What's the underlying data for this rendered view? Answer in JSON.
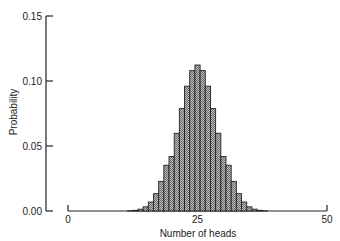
{
  "chart_data": {
    "type": "bar",
    "title": "",
    "xlabel": "Number of heads",
    "ylabel": "Probability",
    "ylim": [
      0,
      0.15
    ],
    "xlim": [
      0,
      50
    ],
    "yticks": [
      "0.00",
      "0.05",
      "0.10",
      "0.15"
    ],
    "xticks": [
      "0",
      "25",
      "50"
    ],
    "grid": false,
    "x": [
      12,
      13,
      14,
      15,
      16,
      17,
      18,
      19,
      20,
      21,
      22,
      23,
      24,
      25,
      26,
      27,
      28,
      29,
      30,
      31,
      32,
      33,
      34,
      35,
      36,
      37,
      38
    ],
    "values": [
      0.0002,
      0.0005,
      0.0014,
      0.0032,
      0.0069,
      0.0133,
      0.0228,
      0.0352,
      0.0419,
      0.0598,
      0.0788,
      0.096,
      0.108,
      0.1123,
      0.108,
      0.096,
      0.0788,
      0.0598,
      0.0419,
      0.0352,
      0.0228,
      0.0133,
      0.0069,
      0.0032,
      0.0014,
      0.0005,
      0.0002
    ],
    "bar_color": "#9a9a9a",
    "edge_color": "#222222"
  }
}
